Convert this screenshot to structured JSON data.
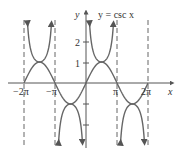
{
  "chart_data": {
    "type": "line",
    "title": "y = csc x",
    "xlabel": "x",
    "ylabel": "y",
    "x_ticks": [
      "-2π",
      "-π",
      "π",
      "2π"
    ],
    "y_ticks": [
      "1",
      "2"
    ],
    "xlim": [
      -6.6,
      7.7
    ],
    "ylim": [
      -3.4,
      3.4
    ],
    "series": [
      {
        "name": "csc x",
        "style": "solid",
        "function": "1/sin(x)",
        "domain": [
          -6.283,
          6.283
        ]
      },
      {
        "name": "sin x",
        "style": "solid",
        "function": "sin(x)",
        "domain": [
          -6.283,
          6.283
        ]
      }
    ],
    "asymptotes": [
      "-2π",
      "-π",
      "0",
      "π",
      "2π"
    ],
    "grid": false
  },
  "labels": {
    "title": "y = csc x",
    "x_axis": "x",
    "y_axis": "y",
    "x_ticks": [
      "−2π",
      "−π",
      "π",
      "2π"
    ],
    "y_ticks": [
      "2",
      "1"
    ]
  }
}
